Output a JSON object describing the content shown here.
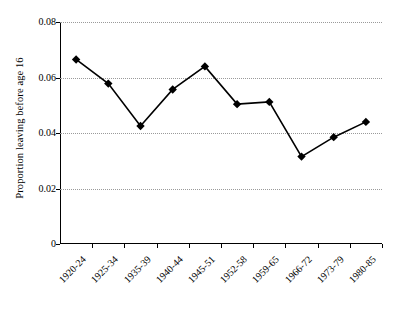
{
  "chart_data": {
    "type": "line",
    "title": "",
    "xlabel": "",
    "ylabel": "Proportion leaving before age 16",
    "categories": [
      "1920-24",
      "1925-34",
      "1935-39",
      "1940-44",
      "1945-51",
      "1952-58",
      "1959-65",
      "1966-72",
      "1973-79",
      "1980-85"
    ],
    "values": [
      0.0665,
      0.0578,
      0.0425,
      0.0557,
      0.064,
      0.0504,
      0.0512,
      0.0315,
      0.0385,
      0.044
    ],
    "ylim": [
      0,
      0.08
    ],
    "yticks": [
      0,
      0.02,
      0.04,
      0.06,
      0.08
    ],
    "ytick_labels": [
      "0",
      "0.02",
      "0.04",
      "0.06",
      "0.08"
    ],
    "grid": "horizontal-dotted",
    "legend": "none",
    "marker": "filled-diamond",
    "line_color": "#000000",
    "grid_color": "#9a9a9a"
  }
}
